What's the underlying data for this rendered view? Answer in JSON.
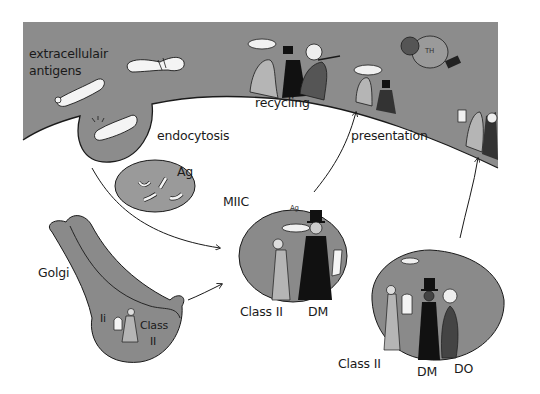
{
  "diagram": {
    "colors": {
      "membrane_fill": "#8c8c8c",
      "vesicle_fill": "#8a8a8a",
      "endosome_fill": "#9a9a9a",
      "outline": "#1a1a1a",
      "background": "#ffffff",
      "antigen_fill": "#f4f4f4"
    },
    "labels": {
      "extracellular_line1": "extracellulair",
      "extracellular_line2": "antigens",
      "endocytosis": "endocytosis",
      "ag_endosome": "Ag",
      "recycling": "recycling",
      "presentation": "presentation",
      "miic": "MIIC",
      "golgi": "Golgi",
      "golgi_ii": "Ii",
      "golgi_class_line1": "Class",
      "golgi_class_line2": "II",
      "miic_class": "Class II",
      "miic_dm": "DM",
      "miic_ag": "Ag",
      "late_class": "Class II",
      "late_dm": "DM",
      "late_do": "DO",
      "th_cell": "TH"
    },
    "compartments": [
      {
        "name": "cell-membrane-surface",
        "label": "recycling / presentation"
      },
      {
        "name": "endocytic-pit",
        "label": "endocytosis"
      },
      {
        "name": "early-endosome",
        "label": "Ag"
      },
      {
        "name": "golgi",
        "label": "Golgi"
      },
      {
        "name": "miic-vesicle",
        "label": "MIIC"
      },
      {
        "name": "late-vesicle",
        "label": "Class II / DM / DO"
      }
    ],
    "arrows": [
      {
        "from": "endocytic-pit",
        "to": "miic-vesicle"
      },
      {
        "from": "golgi",
        "to": "miic-vesicle"
      },
      {
        "from": "miic-vesicle",
        "to": "cell-membrane-surface",
        "label": "presentation"
      },
      {
        "from": "late-vesicle",
        "to": "cell-membrane-surface"
      }
    ]
  }
}
